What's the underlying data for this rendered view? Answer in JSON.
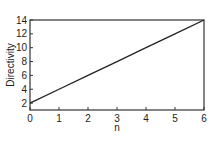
{
  "chart_data": {
    "type": "line",
    "title": "",
    "xlabel": "n",
    "ylabel": "Directivity",
    "xlim": [
      0,
      6
    ],
    "ylim": [
      1,
      14
    ],
    "x_ticks": [
      0,
      1,
      2,
      3,
      4,
      5,
      6
    ],
    "y_ticks": [
      2,
      4,
      6,
      8,
      10,
      12,
      14
    ],
    "grid": false,
    "legend": null,
    "series": [
      {
        "name": "Directivity vs n",
        "x": [
          0,
          1,
          2,
          3,
          4,
          5,
          6
        ],
        "values": [
          2,
          4,
          6,
          8,
          10,
          12,
          14
        ]
      }
    ]
  },
  "labels": {
    "xlabel": "n",
    "ylabel": "Directivity",
    "x_ticks": [
      "0",
      "1",
      "2",
      "3",
      "4",
      "5",
      "6"
    ],
    "y_ticks": [
      "2",
      "4",
      "6",
      "8",
      "10",
      "12",
      "14"
    ]
  },
  "colors": {
    "line": "#222222",
    "axis": "#333333",
    "text": "#222222"
  }
}
